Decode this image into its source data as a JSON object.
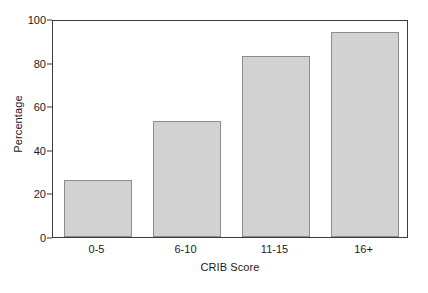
{
  "chart_data": {
    "type": "bar",
    "title": "",
    "subtitle": "",
    "xlabel": "CRIB Score",
    "ylabel": "Percentage",
    "categories": [
      "0-5",
      "6-10",
      "11-15",
      "16+"
    ],
    "values": [
      26,
      53,
      83,
      94
    ],
    "series": [
      {
        "name": "Percentage",
        "values": [
          26,
          53,
          83,
          94
        ]
      }
    ],
    "ylim": [
      0,
      100
    ],
    "yticks": [
      0,
      20,
      40,
      60,
      80,
      100
    ],
    "ytick_labels": [
      "0",
      "20",
      "40",
      "60",
      "80",
      "100"
    ],
    "grid": false,
    "legend": false,
    "legend_position": "none",
    "annotations": [],
    "colors": {
      "bar_fill": "#d2d2d2",
      "bar_border": "#8c8c8c",
      "axis": "#3b3b3b",
      "text": "#1a1a1a",
      "background": "#ffffff"
    }
  }
}
